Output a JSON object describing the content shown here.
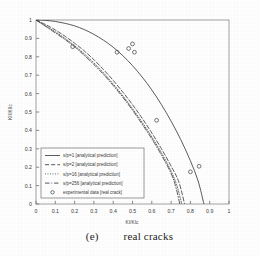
{
  "figure": {
    "caption_label": "(e)",
    "caption_text": "real cracks"
  },
  "axes": {
    "x_title": "KI/KIc",
    "y_title": "KII/KIIc",
    "x_ticks": [
      "0",
      "0.1",
      "0.2",
      "0.3",
      "0.4",
      "0.5",
      "0.6",
      "0.7",
      "0.8",
      "0.9",
      "1"
    ],
    "y_ticks": [
      "0",
      "0.1",
      "0.2",
      "0.3",
      "0.4",
      "0.5",
      "0.6",
      "0.7",
      "0.8",
      "0.9",
      "1"
    ],
    "xlim": [
      0,
      1
    ],
    "ylim": [
      0,
      1
    ]
  },
  "legend": {
    "items": [
      {
        "label": "s/p=1 [analytical prediction]",
        "style": "solid"
      },
      {
        "label": "s/p=2 [analytical prediction]",
        "style": "dashed"
      },
      {
        "label": "s/p=16 [analytical prediction]",
        "style": "dotted"
      },
      {
        "label": "s/p=256 [analytical prediction]",
        "style": "dashdot"
      },
      {
        "label": "experimental data [real crack]",
        "style": "marker-circle"
      }
    ]
  },
  "colors": {
    "ink": "#3a3a3a",
    "frame": "#8c8c8c",
    "background": "#ffffff"
  },
  "chart_data": {
    "type": "line",
    "title": "",
    "xlabel": "KI/KIc",
    "ylabel": "KII/KIIc",
    "xlim": [
      0,
      1
    ],
    "ylim": [
      0,
      1
    ],
    "grid": false,
    "legend_position": "lower-left-inside",
    "series": [
      {
        "name": "s/p=1 [analytical prediction]",
        "style": "solid",
        "x": [
          0.0,
          0.05,
          0.1,
          0.15,
          0.2,
          0.25,
          0.3,
          0.35,
          0.4,
          0.45,
          0.5,
          0.55,
          0.6,
          0.65,
          0.7,
          0.75,
          0.8,
          0.84,
          0.87
        ],
        "y": [
          1.0,
          0.998,
          0.992,
          0.982,
          0.968,
          0.948,
          0.922,
          0.89,
          0.852,
          0.806,
          0.752,
          0.69,
          0.62,
          0.54,
          0.45,
          0.35,
          0.235,
          0.125,
          0.0
        ]
      },
      {
        "name": "s/p=2 [analytical prediction]",
        "style": "dashed",
        "x": [
          0.0,
          0.05,
          0.1,
          0.15,
          0.2,
          0.25,
          0.3,
          0.35,
          0.4,
          0.45,
          0.5,
          0.55,
          0.6,
          0.65,
          0.7,
          0.74,
          0.77
        ],
        "y": [
          1.0,
          0.975,
          0.946,
          0.912,
          0.874,
          0.832,
          0.784,
          0.73,
          0.672,
          0.608,
          0.54,
          0.466,
          0.386,
          0.3,
          0.206,
          0.12,
          0.0
        ]
      },
      {
        "name": "s/p=16 [analytical prediction]",
        "style": "dotted",
        "x": [
          0.0,
          0.05,
          0.1,
          0.15,
          0.2,
          0.25,
          0.3,
          0.35,
          0.4,
          0.45,
          0.5,
          0.55,
          0.6,
          0.65,
          0.7,
          0.73,
          0.755
        ],
        "y": [
          1.0,
          0.968,
          0.936,
          0.9,
          0.86,
          0.816,
          0.766,
          0.712,
          0.652,
          0.588,
          0.518,
          0.444,
          0.364,
          0.278,
          0.178,
          0.1,
          0.0
        ]
      },
      {
        "name": "s/p=256 [analytical prediction]",
        "style": "dashdot",
        "x": [
          0.0,
          0.05,
          0.1,
          0.15,
          0.2,
          0.25,
          0.3,
          0.35,
          0.4,
          0.45,
          0.5,
          0.55,
          0.6,
          0.65,
          0.7,
          0.725,
          0.745
        ],
        "y": [
          1.0,
          0.965,
          0.93,
          0.894,
          0.854,
          0.808,
          0.758,
          0.704,
          0.644,
          0.58,
          0.51,
          0.434,
          0.354,
          0.266,
          0.166,
          0.09,
          0.0
        ]
      },
      {
        "name": "experimental data [real crack]",
        "style": "marker-circle",
        "marker": "o",
        "x": [
          0.19,
          0.42,
          0.48,
          0.5,
          0.51,
          0.625,
          0.8,
          0.845
        ],
        "y": [
          0.855,
          0.825,
          0.845,
          0.87,
          0.825,
          0.455,
          0.175,
          0.205
        ]
      }
    ]
  }
}
